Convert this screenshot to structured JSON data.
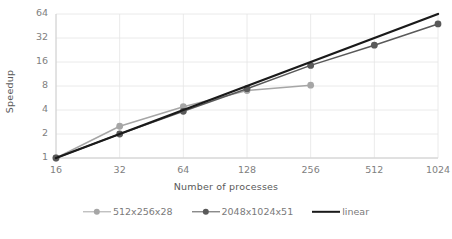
{
  "chart_data": {
    "type": "line",
    "title": "",
    "xlabel": "Number of processes",
    "ylabel": "Speedup",
    "x": [
      16,
      32,
      64,
      128,
      256,
      512,
      1024
    ],
    "xtick_labels": [
      "16",
      "32",
      "64",
      "128",
      "256",
      "512",
      "1024"
    ],
    "ytick_labels": [
      "1",
      "2",
      "4",
      "8",
      "16",
      "32",
      "64"
    ],
    "ytick_values": [
      1,
      2,
      4,
      8,
      16,
      32,
      64
    ],
    "xscale": "log2",
    "yscale": "log2",
    "xlim": [
      16,
      1024
    ],
    "ylim": [
      1,
      64
    ],
    "grid": true,
    "legend_position": "bottom",
    "series": [
      {
        "name": "512x256x28",
        "color": "#a6a6a6",
        "marker": "circle",
        "x": [
          16,
          32,
          64,
          128,
          256
        ],
        "values": [
          1,
          2.5,
          4.4,
          7.0,
          8.2
        ]
      },
      {
        "name": "2048x1024x51",
        "color": "#595959",
        "marker": "circle",
        "x": [
          16,
          32,
          64,
          128,
          256,
          512,
          1024
        ],
        "values": [
          1,
          2.0,
          3.85,
          7.4,
          14.5,
          26,
          48
        ]
      },
      {
        "name": "linear",
        "color": "#1a1a1a",
        "marker": "none",
        "x": [
          16,
          1024
        ],
        "values": [
          1,
          64
        ]
      }
    ]
  },
  "axes": {
    "y_title": "Speedup",
    "x_title": "Number of processes"
  },
  "legend": {
    "items": [
      {
        "label": "512x256x28"
      },
      {
        "label": "2048x1024x51"
      },
      {
        "label": "linear"
      }
    ]
  },
  "colors": {
    "series_light": "#a6a6a6",
    "series_dark": "#595959",
    "series_linear": "#1a1a1a",
    "grid": "#e4e4e4",
    "axis": "#d0d0d0",
    "tick_text": "#808080",
    "title_text": "#595959",
    "background": "#ffffff"
  }
}
